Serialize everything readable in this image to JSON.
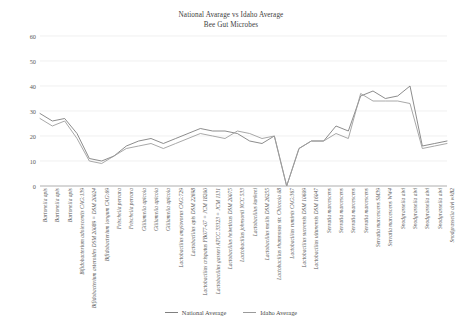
{
  "chart_data": {
    "type": "line",
    "title": "National Avarage vs Idaho Average",
    "subtitle": "Bee Gut Microbes",
    "xlabel": "",
    "ylabel": "",
    "ylim": [
      0,
      60
    ],
    "yticks": [
      0,
      10,
      20,
      30,
      40,
      50,
      60
    ],
    "grid": true,
    "legend_position": "bottom",
    "categories": [
      "Bartonella apis",
      "Bartonella apis",
      "Bartonella apis",
      "Bifidobacterium adolescentis CAG:139",
      "Bifidobacterium asteroides DSM 20089 = DSM 20024",
      "Bifidobacterium longum CAG:69",
      "Frischella perrara",
      "Frischella perrara",
      "Gilliamella apicola",
      "Gilliamella apicola",
      "Gilliamella apicola",
      "Lactobacillus amylovorus CAG:729",
      "Lactobacillus apis DSM 22698",
      "Lactobacillus crispatus FB077-07 = JCM 18200",
      "Lactobacillus gasseri ATCC 33323 = JCM 1131",
      "Lactobacillus helveticus DSM 20075",
      "Lactobacillus johnsonii NCC 533",
      "Lactobacillus kunkeei",
      "Lactobacillus mellis DSM 26255",
      "Lactobacillus rhamnosus str. Chiocola 08",
      "Lactobacillus ruminis CAG:367",
      "Lactobacillus sucrensis DSM 10609",
      "Lactobacillus ultunensis DSM 16047",
      "Serratia marcescens",
      "Serratia marcescens",
      "Serratia marcescens",
      "Serratia marcescens",
      "Serratia marcescens SM39",
      "Serratia marcescens WW4",
      "Snodgrassella alvi",
      "Snodgrassella alvi",
      "Snodgrassella alvi",
      "Snodgrassella alvi",
      "Snodgrassella alvi wkB2"
    ],
    "series": [
      {
        "name": "National Average",
        "color": "#7f7f7f",
        "values": [
          29,
          26,
          27,
          21,
          11,
          10,
          12,
          16,
          18,
          19,
          17,
          19,
          21,
          23,
          22,
          22,
          21,
          18,
          17,
          20,
          0,
          15,
          18,
          18,
          24,
          22,
          36,
          38,
          35,
          36,
          40,
          16,
          17,
          18
        ]
      },
      {
        "name": "Idaho Average",
        "color": "#9e9e9e",
        "values": [
          27,
          24,
          26,
          19,
          10,
          9,
          12,
          15,
          16,
          17,
          15,
          17,
          19,
          21,
          20,
          19,
          22,
          21,
          19,
          20,
          0,
          15,
          18,
          18,
          21,
          19,
          37,
          34,
          34,
          34,
          33,
          15,
          16,
          17
        ]
      }
    ]
  },
  "legend": {
    "items": [
      {
        "label": "National Average"
      },
      {
        "label": "Idaho Average"
      }
    ]
  }
}
